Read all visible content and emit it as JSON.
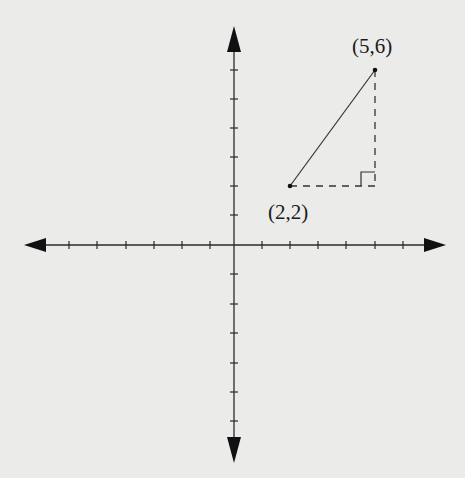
{
  "diagram": {
    "type": "coordinate-plane",
    "colors": {
      "background": "#ebebea",
      "ink": "#1a1a1a"
    },
    "axes": {
      "x_ticks_each_side": 6,
      "y_ticks_each_side": 6,
      "arrows": [
        "left",
        "right",
        "up",
        "down"
      ]
    },
    "points": [
      {
        "id": "A",
        "label": "(2,2)",
        "x": 2,
        "y": 2
      },
      {
        "id": "B",
        "label": "(5,6)",
        "x": 5,
        "y": 6
      }
    ],
    "segments": [
      {
        "from": "A",
        "to": "B",
        "style": "solid"
      },
      {
        "from": "A",
        "to": "C",
        "style": "dashed"
      },
      {
        "from": "C",
        "to": "B",
        "style": "dashed"
      }
    ],
    "right_angle_at": {
      "x": 5,
      "y": 2
    },
    "labels": {
      "point_a": "(2,2)",
      "point_b": "(5,6)"
    }
  }
}
